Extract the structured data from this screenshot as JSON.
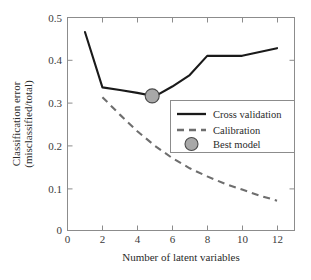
{
  "chart_data": {
    "type": "line",
    "title": "",
    "xlabel": "Number of latent variables",
    "ylabel_line1": "Classification error",
    "ylabel_line2": "(misclassified/total)",
    "xlim": [
      0,
      13
    ],
    "ylim": [
      0,
      0.5
    ],
    "grid": false,
    "legend_position": "center-right",
    "xticks": [
      0,
      2,
      4,
      6,
      8,
      10,
      12
    ],
    "xtick_labels": [
      "0",
      "2",
      "4",
      "6",
      "8",
      "10",
      "12"
    ],
    "yticks": [
      0,
      0.1,
      0.2,
      0.3,
      0.4,
      0.5
    ],
    "ytick_labels": [
      "0",
      "0.1",
      "0.2",
      "0.3",
      "0.4",
      "0.5"
    ],
    "series": [
      {
        "name": "Cross validation",
        "style": "solid",
        "color": "#1a1a1a",
        "x": [
          1,
          2,
          3,
          4,
          5,
          6,
          7,
          8,
          10,
          12
        ],
        "values": [
          0.466,
          0.336,
          0.33,
          0.323,
          0.315,
          0.338,
          0.365,
          0.41,
          0.41,
          0.428
        ]
      },
      {
        "name": "Calibration",
        "style": "dashed",
        "color": "#6e6e6e",
        "x": [
          2,
          3,
          4,
          5,
          6,
          7,
          8,
          9,
          10,
          11,
          12
        ],
        "values": [
          0.313,
          0.272,
          0.233,
          0.199,
          0.17,
          0.146,
          0.127,
          0.11,
          0.096,
          0.082,
          0.07
        ]
      }
    ],
    "markers": [
      {
        "name": "Best model",
        "x": 4.85,
        "y": 0.316,
        "fill": "#a8a8a8",
        "stroke": "#4a4a4a"
      }
    ],
    "legend_entries": [
      {
        "label": "Cross validation",
        "type": "solid-line"
      },
      {
        "label": "Calibration",
        "type": "dashed-line"
      },
      {
        "label": "Best model",
        "type": "circle-marker"
      }
    ]
  }
}
